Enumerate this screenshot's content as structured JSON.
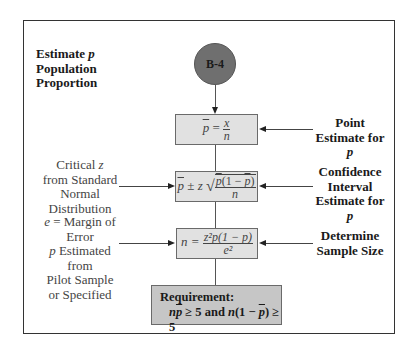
{
  "diagram": {
    "title": "Estimate p Population Proportion",
    "title_lines": [
      "Estimate ",
      "p",
      "Population",
      "Proportion"
    ],
    "start_node": {
      "label": "B-4",
      "shape": "circle",
      "color": "#6f6f6f"
    },
    "steps": [
      {
        "id": "point-estimate",
        "formula_text": "p̄ = x/n",
        "formula": {
          "lhs": "p̄ =",
          "num": "x",
          "den": "n"
        },
        "right_label_lines": [
          "Point",
          "Estimate for ",
          "p"
        ]
      },
      {
        "id": "confidence-interval",
        "formula_text": "p̄ ± z √(p̄(1 − p̄)/n)",
        "formula": {
          "lhs": "p̄ ± z",
          "num_a": "p",
          "num_b": "(1 − ",
          "num_c": "p",
          "num_d": ")",
          "den": "n"
        },
        "left_label_lines": [
          "Critical ",
          "z",
          "from Standard",
          "Normal",
          "Distribution"
        ],
        "right_label_lines": [
          "Confidence",
          "Interval",
          "Estimate for ",
          "p"
        ]
      },
      {
        "id": "sample-size",
        "formula_text": "n = z²p(1 − p)/e²",
        "formula": {
          "lhs": "n =",
          "num": "z²p(1 − p)",
          "den": "e²"
        },
        "left_label_lines": [
          "e",
          " = Margin of",
          "Error",
          "p",
          " Estimated from",
          "Pilot Sample",
          "or Specified"
        ],
        "right_label_lines": [
          "Determine",
          "Sample Size"
        ]
      }
    ],
    "requirement": {
      "heading": "Requirement:",
      "condition_text": "np̄ ≥ 5 and n(1 − p̄) ≥ 5",
      "parts": {
        "n1": "n",
        "p1": "p",
        "mid": " ≥ 5 and ",
        "n2": "n",
        "open": "(1 − ",
        "p2": "p",
        "close": ") ≥ 5"
      },
      "color": "#c6c6c6"
    },
    "colors": {
      "box_fill": "#e1e1e1",
      "border": "#333333"
    }
  }
}
